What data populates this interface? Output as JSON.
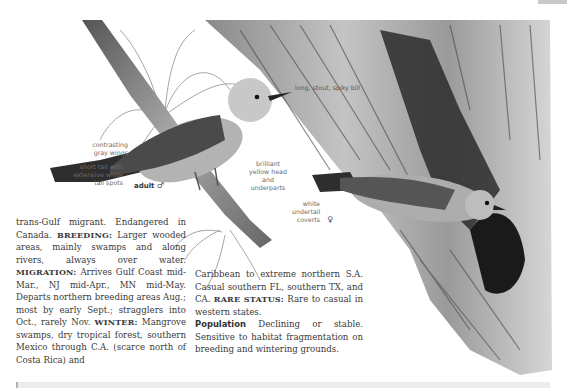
{
  "page": {
    "corner_tab": "gray-page-tab",
    "illustration": {
      "subject": "two warblers: adult male perched on branch with air plant, female at tree-cavity nest",
      "labels": {
        "bill": "long, stout, spiky bill",
        "wings": "contrasting gray wings",
        "tail": "short tail with extensive white tail spots",
        "adult_male": "adult",
        "male_symbol": "♂",
        "head": "brilliant yellow head and underparts",
        "undertail": "white undertail coverts",
        "female_symbol": "♀"
      }
    },
    "columns": {
      "col1": {
        "intro": "trans-Gulf migrant. Endangered in Canada.",
        "breeding_label": "BREEDING:",
        "breeding_text": "Larger wooded areas, mainly swamps and along rivers, always over water.",
        "migration_label": "MIGRATION:",
        "migration_text": "Arrives Gulf Coast mid-Mar., NJ mid-Apr., MN mid-May. Departs northern breeding areas Aug.; most by early Sept.; stragglers into Oct., rarely Nov.",
        "winter_label": "WINTER:",
        "winter_text": "Mangrove swamps, dry tropical forest, southern Mexico through C.A. (scarce north of Costa Rica) and"
      },
      "col2": {
        "winter_cont": "Caribbean to extreme northern S.A. Casual southern FL, southern TX, and CA.",
        "rare_label": "RARE STATUS:",
        "rare_text": "Rare to casual in western states.",
        "population_label": "Population",
        "population_text": "Declining or stable. Sensitive to habitat fragmentation on breeding and wintering grounds."
      }
    }
  }
}
